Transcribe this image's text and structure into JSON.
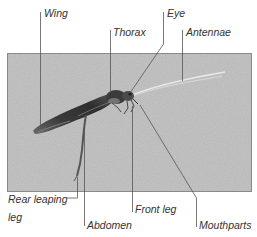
{
  "diagram": {
    "colors": {
      "photo_background": "#c9c9c9",
      "photo_border": "#8a8a8a",
      "leader_line": "#555555",
      "label_text": "#333333",
      "insect_body": "#3a3a3a"
    },
    "labels": {
      "wing": "Wing",
      "thorax": "Thorax",
      "eye": "Eye",
      "antennae": "Antennae",
      "rear_leaping_leg_line1": "Rear leaping",
      "rear_leaping_leg_line2": "leg",
      "abdomen": "Abdomen",
      "front_leg": "Front leg",
      "mouthparts": "Mouthparts"
    }
  }
}
